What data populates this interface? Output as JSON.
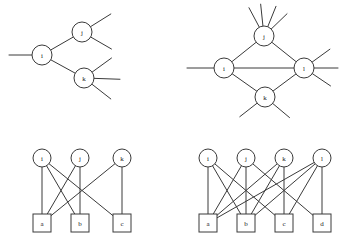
{
  "figure": {
    "background_color": "#ffffff",
    "stroke_color": "#3a3a3a",
    "node_fill": "#ffffff",
    "label_color": "#1a1a1a"
  },
  "panels": [
    {
      "id": "top-left",
      "name": "tree-graph-ijk",
      "type": "node-link",
      "node_shape": "circle",
      "nodes": [
        {
          "id": "i",
          "label": "i",
          "x": 42,
          "y": 55,
          "r": 10
        },
        {
          "id": "j",
          "label": "j",
          "x": 82,
          "y": 32,
          "r": 10
        },
        {
          "id": "k",
          "label": "k",
          "x": 84,
          "y": 78,
          "r": 10
        }
      ],
      "edges": [
        {
          "from": "i",
          "to": "j"
        },
        {
          "from": "i",
          "to": "k"
        }
      ],
      "stubs": [
        {
          "node": "i",
          "angle": 180,
          "length": 23
        },
        {
          "node": "j",
          "angle": -32,
          "length": 24
        },
        {
          "node": "j",
          "angle": 30,
          "length": 24
        },
        {
          "node": "k",
          "angle": -36,
          "length": 24
        },
        {
          "node": "k",
          "angle": 2,
          "length": 26
        },
        {
          "node": "k",
          "angle": 38,
          "length": 24
        }
      ]
    },
    {
      "id": "top-right",
      "name": "diamond-graph-ijkl",
      "type": "node-link",
      "node_shape": "circle",
      "nodes": [
        {
          "id": "i",
          "label": "i",
          "x": 48,
          "y": 68,
          "r": 10
        },
        {
          "id": "j",
          "label": "j",
          "x": 88,
          "y": 36,
          "r": 10
        },
        {
          "id": "k",
          "label": "k",
          "x": 89,
          "y": 97,
          "r": 10
        },
        {
          "id": "l",
          "label": "l",
          "x": 128,
          "y": 68,
          "r": 10
        }
      ],
      "edges": [
        {
          "from": "i",
          "to": "j"
        },
        {
          "from": "j",
          "to": "l"
        },
        {
          "from": "i",
          "to": "k"
        },
        {
          "from": "k",
          "to": "l"
        },
        {
          "from": "i",
          "to": "l"
        }
      ],
      "stubs": [
        {
          "node": "i",
          "angle": 180,
          "length": 27
        },
        {
          "node": "j",
          "angle": -118,
          "length": 22
        },
        {
          "node": "j",
          "angle": -96,
          "length": 22
        },
        {
          "node": "j",
          "angle": -68,
          "length": 22
        },
        {
          "node": "j",
          "angle": -44,
          "length": 22
        },
        {
          "node": "l",
          "angle": -36,
          "length": 22
        },
        {
          "node": "l",
          "angle": 0,
          "length": 24
        },
        {
          "node": "l",
          "angle": 34,
          "length": 22
        },
        {
          "node": "k",
          "angle": 142,
          "length": 22
        },
        {
          "node": "k",
          "angle": 40,
          "length": 22
        }
      ]
    },
    {
      "id": "bottom-left",
      "name": "bipartite-graph-3x3",
      "type": "bipartite",
      "top_shape": "circle",
      "bottom_shape": "square",
      "top_nodes": [
        {
          "id": "i",
          "label": "i",
          "x": 42,
          "y": 33,
          "r": 9
        },
        {
          "id": "j",
          "label": "j",
          "x": 80,
          "y": 33,
          "r": 9
        },
        {
          "id": "k",
          "label": "k",
          "x": 122,
          "y": 33,
          "r": 9
        }
      ],
      "bottom_nodes": [
        {
          "id": "a",
          "label": "a",
          "x": 42,
          "y": 98,
          "w": 18,
          "h": 18
        },
        {
          "id": "b",
          "label": "b",
          "x": 80,
          "y": 98,
          "w": 18,
          "h": 18
        },
        {
          "id": "c",
          "label": "c",
          "x": 122,
          "y": 98,
          "w": 18,
          "h": 18
        }
      ],
      "edges": [
        {
          "from": "i",
          "to": "a"
        },
        {
          "from": "i",
          "to": "b"
        },
        {
          "from": "i",
          "to": "c"
        },
        {
          "from": "j",
          "to": "a"
        },
        {
          "from": "j",
          "to": "b"
        },
        {
          "from": "k",
          "to": "a"
        },
        {
          "from": "k",
          "to": "c"
        }
      ],
      "edge_count": 7
    },
    {
      "id": "bottom-right",
      "name": "bipartite-graph-4x4",
      "type": "bipartite",
      "top_shape": "circle",
      "bottom_shape": "square",
      "top_nodes": [
        {
          "id": "i",
          "label": "i",
          "x": 32,
          "y": 33,
          "r": 9
        },
        {
          "id": "j",
          "label": "j",
          "x": 70,
          "y": 33,
          "r": 9
        },
        {
          "id": "k",
          "label": "k",
          "x": 108,
          "y": 33,
          "r": 9
        },
        {
          "id": "l",
          "label": "l",
          "x": 146,
          "y": 33,
          "r": 9
        }
      ],
      "bottom_nodes": [
        {
          "id": "a",
          "label": "a",
          "x": 32,
          "y": 98,
          "w": 18,
          "h": 18
        },
        {
          "id": "b",
          "label": "b",
          "x": 70,
          "y": 98,
          "w": 18,
          "h": 18
        },
        {
          "id": "c",
          "label": "c",
          "x": 108,
          "y": 98,
          "w": 18,
          "h": 18
        },
        {
          "id": "d",
          "label": "d",
          "x": 146,
          "y": 98,
          "w": 18,
          "h": 18
        }
      ],
      "edges": [
        {
          "from": "i",
          "to": "a"
        },
        {
          "from": "i",
          "to": "b"
        },
        {
          "from": "i",
          "to": "c"
        },
        {
          "from": "j",
          "to": "a"
        },
        {
          "from": "j",
          "to": "b"
        },
        {
          "from": "j",
          "to": "d"
        },
        {
          "from": "k",
          "to": "a"
        },
        {
          "from": "k",
          "to": "b"
        },
        {
          "from": "k",
          "to": "c"
        },
        {
          "from": "l",
          "to": "a"
        },
        {
          "from": "l",
          "to": "b"
        },
        {
          "from": "l",
          "to": "c"
        },
        {
          "from": "l",
          "to": "d"
        }
      ],
      "edge_count": 13
    }
  ],
  "panel_layout": [
    {
      "id": "top-left",
      "left": 0,
      "top": 0,
      "width": 176,
      "height": 125
    },
    {
      "id": "top-right",
      "left": 176,
      "top": 0,
      "width": 176,
      "height": 125
    },
    {
      "id": "bottom-left",
      "left": 0,
      "top": 125,
      "width": 176,
      "height": 124
    },
    {
      "id": "bottom-right",
      "left": 176,
      "top": 125,
      "width": 176,
      "height": 124
    }
  ]
}
